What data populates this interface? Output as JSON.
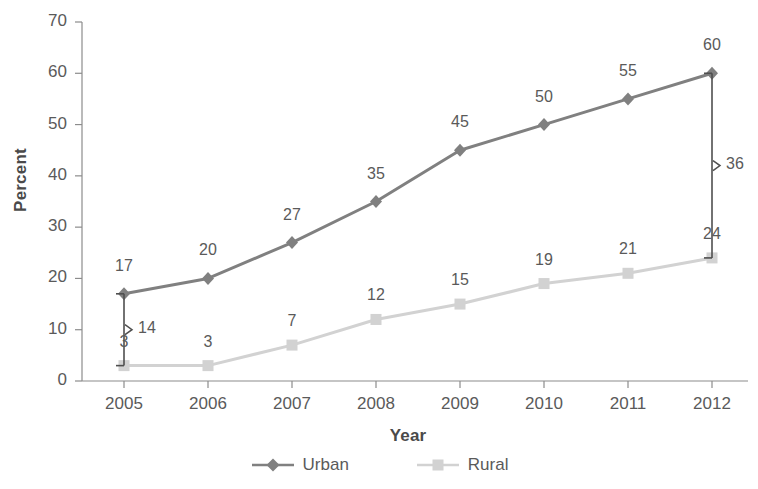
{
  "chart_data": {
    "type": "line",
    "title": "",
    "xlabel": "Year",
    "ylabel": "Percent",
    "categories": [
      "2005",
      "2006",
      "2007",
      "2008",
      "2009",
      "2010",
      "2011",
      "2012"
    ],
    "ylim": [
      0,
      70
    ],
    "y_ticks": [
      "0",
      "10",
      "20",
      "30",
      "40",
      "50",
      "60",
      "70"
    ],
    "grid": false,
    "legend_position": "bottom",
    "series": [
      {
        "name": "Urban",
        "color": "#808080",
        "marker": "diamond",
        "values": [
          17,
          20,
          27,
          35,
          45,
          50,
          55,
          60
        ],
        "labels": [
          "17",
          "20",
          "27",
          "35",
          "45",
          "50",
          "55",
          "60"
        ]
      },
      {
        "name": "Rural",
        "color": "#d2d2d2",
        "marker": "square",
        "values": [
          3,
          3,
          7,
          12,
          15,
          19,
          21,
          24
        ],
        "labels": [
          "3",
          "3",
          "7",
          "12",
          "15",
          "19",
          "21",
          "24"
        ]
      }
    ],
    "annotations": [
      {
        "category": "2005",
        "label": "14",
        "from": 17,
        "to": 3
      },
      {
        "category": "2012",
        "label": "36",
        "from": 60,
        "to": 24
      }
    ]
  },
  "axes": {
    "y_title": "Percent",
    "x_title": "Year"
  },
  "legend": {
    "items": [
      {
        "label": "Urban"
      },
      {
        "label": "Rural"
      }
    ]
  }
}
